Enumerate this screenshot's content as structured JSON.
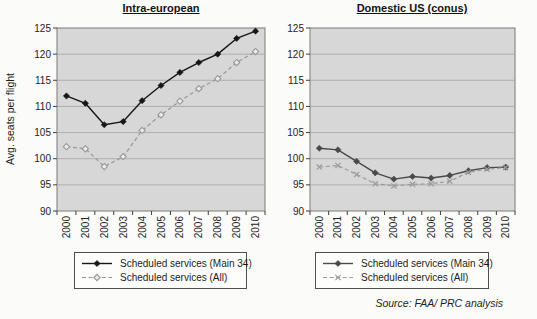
{
  "figure": {
    "ylabel": "Avg. seats per flight",
    "source_note": "Source: FAA/ PRC analysis",
    "colors": {
      "plot_background": "#d7d7d7",
      "gridline": "#a9a9a9",
      "plot_border": "#7a7a7a",
      "axis": "#3f3f3f",
      "text": "#242424"
    }
  },
  "chart_data": [
    {
      "type": "line",
      "title": "Intra-european",
      "ylabel": "Avg. seats per flight",
      "xlabel": "",
      "categories": [
        "2000",
        "2001",
        "2002",
        "2003",
        "2004",
        "2005",
        "2006",
        "2007",
        "2008",
        "2009",
        "2010"
      ],
      "ylim": [
        90,
        125
      ],
      "ytick_step": 5,
      "grid": true,
      "legend_position": "bottom",
      "series": [
        {
          "name": "Scheduled services (Main 34)",
          "values": [
            112.0,
            110.6,
            106.5,
            107.1,
            111.1,
            114.0,
            116.5,
            118.4,
            120.0,
            123.0,
            124.4
          ],
          "color": "#161616",
          "line": "solid",
          "marker": "diamond-filled"
        },
        {
          "name": "Scheduled services (All)",
          "values": [
            102.3,
            101.9,
            98.5,
            100.4,
            105.4,
            108.4,
            111.0,
            113.4,
            115.3,
            118.4,
            120.5
          ],
          "color": "#989898",
          "line": "dashed",
          "marker": "diamond-open"
        }
      ]
    },
    {
      "type": "line",
      "title": "Domestic US (conus)",
      "ylabel": "",
      "xlabel": "",
      "categories": [
        "2000",
        "2001",
        "2002",
        "2003",
        "2004",
        "2005",
        "2006",
        "2007",
        "2008",
        "2009",
        "2010"
      ],
      "ylim": [
        90,
        125
      ],
      "ytick_step": 5,
      "grid": true,
      "legend_position": "bottom",
      "series": [
        {
          "name": "Scheduled services (Main 34)",
          "values": [
            102.0,
            101.7,
            99.5,
            97.3,
            96.1,
            96.6,
            96.3,
            96.8,
            97.7,
            98.3,
            98.4
          ],
          "color": "#4a4a4a",
          "line": "solid",
          "marker": "diamond-filled"
        },
        {
          "name": "Scheduled services (All)",
          "values": [
            98.4,
            98.7,
            97.0,
            95.2,
            94.8,
            95.1,
            95.2,
            95.7,
            97.4,
            98.0,
            98.3
          ],
          "color": "#9b9b9b",
          "line": "dashed",
          "marker": "x-cross"
        }
      ]
    }
  ]
}
